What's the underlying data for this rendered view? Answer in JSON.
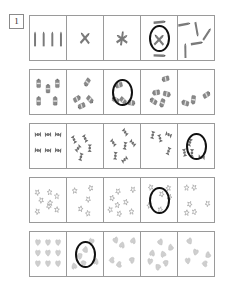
{
  "worksheet": {
    "exercise_number": "1",
    "rows": [
      {
        "id": "row-pencils",
        "object": "pencil",
        "object_color": "#7a7a7a",
        "cells": [
          {
            "id": "cell-1-1",
            "count": 4,
            "layout": "upright-line",
            "circled": false
          },
          {
            "id": "cell-1-2",
            "count": 2,
            "layout": "crossed",
            "circled": false
          },
          {
            "id": "cell-1-3",
            "count": 3,
            "layout": "star-cross",
            "circled": false
          },
          {
            "id": "cell-1-4",
            "count": 4,
            "layout": "crossed-plus",
            "circled": true
          },
          {
            "id": "cell-1-5",
            "count": 5,
            "layout": "scattered",
            "circled": false
          }
        ]
      },
      {
        "id": "row-batteries",
        "object": "battery",
        "object_color": "#8a8a8a",
        "cells": [
          {
            "id": "cell-2-1",
            "count": 5,
            "layout": "upright-grid",
            "circled": false
          },
          {
            "id": "cell-2-2",
            "count": 4,
            "layout": "scattered",
            "circled": false
          },
          {
            "id": "cell-2-3",
            "count": 4,
            "layout": "scattered",
            "circled": true
          },
          {
            "id": "cell-2-4",
            "count": 5,
            "layout": "scattered",
            "circled": false
          },
          {
            "id": "cell-2-5",
            "count": 3,
            "layout": "scattered",
            "circled": false
          }
        ]
      },
      {
        "id": "row-bowties",
        "object": "bowtie",
        "object_color": "#6e6e6e",
        "cells": [
          {
            "id": "cell-3-1",
            "count": 6,
            "layout": "grid",
            "circled": false
          },
          {
            "id": "cell-3-2",
            "count": 5,
            "layout": "scattered",
            "circled": false
          },
          {
            "id": "cell-3-3",
            "count": 6,
            "layout": "scattered",
            "circled": false
          },
          {
            "id": "cell-3-4",
            "count": 4,
            "layout": "scattered",
            "circled": false
          },
          {
            "id": "cell-3-5",
            "count": 4,
            "layout": "scattered",
            "circled": true
          }
        ]
      },
      {
        "id": "row-stars",
        "object": "star",
        "object_color": "#9b9b9b",
        "cells": [
          {
            "id": "cell-4-1",
            "count": 8,
            "layout": "scattered",
            "circled": false
          },
          {
            "id": "cell-4-2",
            "count": 5,
            "layout": "scattered",
            "circled": false
          },
          {
            "id": "cell-4-3",
            "count": 8,
            "layout": "scattered",
            "circled": false
          },
          {
            "id": "cell-4-4",
            "count": 6,
            "layout": "scattered",
            "circled": true
          },
          {
            "id": "cell-4-5",
            "count": 6,
            "layout": "scattered",
            "circled": false
          }
        ]
      },
      {
        "id": "row-hearts",
        "object": "heart",
        "object_color": "#a8a8a8",
        "cells": [
          {
            "id": "cell-5-1",
            "count": 9,
            "layout": "grid",
            "circled": false
          },
          {
            "id": "cell-5-2",
            "count": 6,
            "layout": "scattered",
            "circled": true
          },
          {
            "id": "cell-5-3",
            "count": 6,
            "layout": "scattered",
            "circled": false
          },
          {
            "id": "cell-5-4",
            "count": 7,
            "layout": "scattered",
            "circled": false
          },
          {
            "id": "cell-5-5",
            "count": 5,
            "layout": "scattered",
            "circled": false
          }
        ]
      }
    ]
  },
  "colors": {
    "frame": "#9a9a9a",
    "mark": "#111111",
    "page": "#ffffff"
  }
}
